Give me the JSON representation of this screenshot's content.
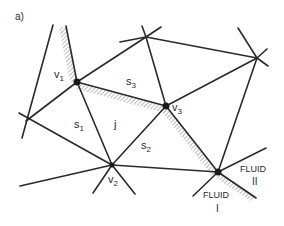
{
  "figure": {
    "panel_label": "a)",
    "colors": {
      "line": "#2a2a2a",
      "node": "#1a1a1a",
      "hatch": "#555555",
      "background": "#ffffff"
    }
  },
  "labels": {
    "v1": {
      "base": "v",
      "sub": "1"
    },
    "v2": {
      "base": "v",
      "sub": "2"
    },
    "v3": {
      "base": "v",
      "sub": "3"
    },
    "s1": {
      "base": "s",
      "sub": "1"
    },
    "s2": {
      "base": "s",
      "sub": "2"
    },
    "s3": {
      "base": "s",
      "sub": "3"
    },
    "j": "j",
    "fluid_1": {
      "name": "FLUID",
      "numeral": "I"
    },
    "fluid_2": {
      "name": "FLUID",
      "numeral": "II"
    }
  }
}
